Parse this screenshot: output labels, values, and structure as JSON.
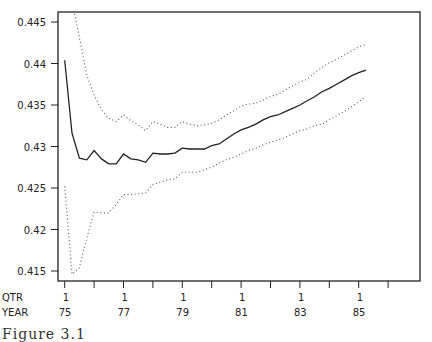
{
  "chart_data": {
    "type": "line",
    "title": "",
    "xlabel": "",
    "ylabel": "",
    "x_axis_rows": [
      {
        "label": "QTR",
        "ticks": [
          "1",
          "1",
          "1",
          "1",
          "1",
          "1"
        ]
      },
      {
        "label": "YEAR",
        "ticks": [
          "75",
          "77",
          "79",
          "81",
          "83",
          "85"
        ]
      }
    ],
    "x_start": "1975Q1",
    "x_frequency": "quarterly",
    "x": [
      "75Q1",
      "75Q2",
      "75Q3",
      "75Q4",
      "76Q1",
      "76Q2",
      "76Q3",
      "76Q4",
      "77Q1",
      "77Q2",
      "77Q3",
      "77Q4",
      "78Q1",
      "78Q2",
      "78Q3",
      "78Q4",
      "79Q1",
      "79Q2",
      "79Q3",
      "79Q4",
      "80Q1",
      "80Q2",
      "80Q3",
      "80Q4",
      "81Q1",
      "81Q2",
      "81Q3",
      "81Q4",
      "82Q1",
      "82Q2",
      "82Q3",
      "82Q4",
      "83Q1",
      "83Q2",
      "83Q3",
      "83Q4",
      "84Q1",
      "84Q2",
      "84Q3",
      "84Q4",
      "85Q1",
      "85Q2"
    ],
    "y_ticks": [
      0.415,
      0.42,
      0.425,
      0.43,
      0.435,
      0.44,
      0.445
    ],
    "y_tick_labels": [
      "0.415",
      "0.42",
      "0.425",
      "0.43",
      "0.435",
      "0.44",
      "0.445"
    ],
    "ylim": [
      0.4138,
      0.4463
    ],
    "grid": false,
    "legend": null,
    "series": [
      {
        "name": "estimate",
        "style": "solid",
        "values": [
          0.4404,
          0.4316,
          0.4286,
          0.4284,
          0.4295,
          0.4285,
          0.4279,
          0.4279,
          0.4291,
          0.4285,
          0.4284,
          0.4281,
          0.4292,
          0.4291,
          0.4291,
          0.4292,
          0.4298,
          0.4297,
          0.4297,
          0.4297,
          0.4301,
          0.4303,
          0.4309,
          0.4315,
          0.432,
          0.4323,
          0.4327,
          0.4332,
          0.4336,
          0.4338,
          0.4342,
          0.4346,
          0.435,
          0.4355,
          0.436,
          0.4366,
          0.437,
          0.4375,
          0.438,
          0.4385,
          0.4389,
          0.4392
        ]
      },
      {
        "name": "upper band",
        "style": "dotted",
        "values": [
          0.455,
          0.4475,
          0.4431,
          0.4386,
          0.4362,
          0.4344,
          0.4334,
          0.433,
          0.4338,
          0.4331,
          0.4326,
          0.4319,
          0.433,
          0.4327,
          0.4323,
          0.4323,
          0.433,
          0.4327,
          0.4325,
          0.4326,
          0.4328,
          0.4332,
          0.4338,
          0.4343,
          0.4349,
          0.4351,
          0.4352,
          0.4356,
          0.436,
          0.4363,
          0.4368,
          0.4373,
          0.4378,
          0.4381,
          0.4389,
          0.4395,
          0.4401,
          0.4405,
          0.441,
          0.4415,
          0.442,
          0.4423
        ]
      },
      {
        "name": "lower band",
        "style": "dotted",
        "values": [
          0.4252,
          0.4146,
          0.4154,
          0.419,
          0.4221,
          0.422,
          0.422,
          0.423,
          0.4242,
          0.4242,
          0.4243,
          0.4244,
          0.4254,
          0.4257,
          0.426,
          0.4261,
          0.4269,
          0.4269,
          0.4269,
          0.4272,
          0.4275,
          0.428,
          0.4284,
          0.4287,
          0.4291,
          0.4295,
          0.4298,
          0.4302,
          0.4305,
          0.4308,
          0.4311,
          0.4315,
          0.4319,
          0.4321,
          0.4325,
          0.4327,
          0.4332,
          0.4337,
          0.4342,
          0.4348,
          0.4354,
          0.436
        ]
      }
    ]
  },
  "caption": "Figure 3.1"
}
